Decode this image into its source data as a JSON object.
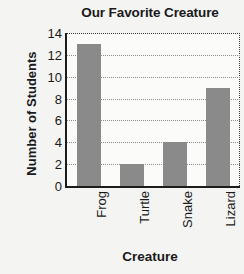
{
  "chart_data": {
    "type": "bar",
    "title": "Our Favorite Creature",
    "xlabel": "Creature",
    "ylabel": "Number of Students",
    "categories": [
      "Frog",
      "Turtle",
      "Snake",
      "Lizard"
    ],
    "values": [
      13,
      2,
      4,
      9
    ],
    "ylim": [
      0,
      14
    ],
    "ytick_labels": [
      "0",
      "2",
      "4",
      "6",
      "8",
      "10",
      "12",
      "14"
    ],
    "ytick_values": [
      0,
      2,
      4,
      6,
      8,
      10,
      12,
      14
    ],
    "grid": true,
    "legend": "none",
    "bar_color": "#8a8a8a",
    "axis_color": "#1c1c1c",
    "gridline_color": "#8e8e8e",
    "background_color": "#f4f4f2",
    "plot_background_color": "#fbfbfa",
    "xtick_label_rotation": "90"
  }
}
